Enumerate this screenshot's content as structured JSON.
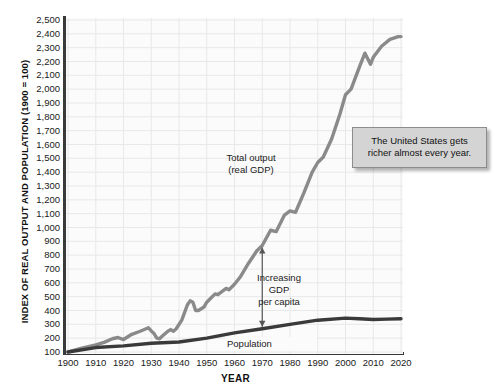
{
  "chart_data": {
    "type": "line",
    "title": "",
    "xlabel": "YEAR",
    "ylabel": "INDEX OF REAL OUTPUT AND POPULATION (1900 = 100)",
    "xlim": [
      1900,
      2020
    ],
    "ylim": [
      100,
      2500
    ],
    "grid": true,
    "legend": "inline-annotations",
    "x_ticks": [
      "1900",
      "1910",
      "1920",
      "1930",
      "1940",
      "1950",
      "1960",
      "1970",
      "1980",
      "1990",
      "2000",
      "2010",
      "2020"
    ],
    "y_ticks": [
      "100",
      "200",
      "300",
      "400",
      "500",
      "600",
      "700",
      "800",
      "900",
      "1,000",
      "1,100",
      "1,200",
      "1,300",
      "1,400",
      "1,500",
      "1,600",
      "1,700",
      "1,800",
      "1,900",
      "2,000",
      "2,100",
      "2,200",
      "2,300",
      "2,400",
      "2,500"
    ],
    "series": [
      {
        "name": "Total output (real GDP)",
        "color": "#8a8a8a",
        "x": [
          1900,
          1905,
          1910,
          1913,
          1916,
          1918,
          1920,
          1923,
          1926,
          1929,
          1930,
          1931,
          1932,
          1933,
          1934,
          1936,
          1937,
          1938,
          1939,
          1941,
          1943,
          1944,
          1945,
          1946,
          1947,
          1949,
          1950,
          1953,
          1954,
          1957,
          1958,
          1960,
          1962,
          1965,
          1968,
          1970,
          1973,
          1975,
          1978,
          1980,
          1982,
          1985,
          1988,
          1990,
          1992,
          1995,
          1998,
          2000,
          2002,
          2005,
          2007,
          2009,
          2010,
          2013,
          2016,
          2019,
          2020
        ],
        "y": [
          100,
          128,
          152,
          170,
          196,
          205,
          190,
          228,
          250,
          275,
          252,
          233,
          200,
          196,
          215,
          250,
          262,
          250,
          268,
          330,
          440,
          470,
          460,
          400,
          400,
          425,
          460,
          520,
          515,
          560,
          550,
          590,
          640,
          740,
          830,
          870,
          980,
          970,
          1090,
          1120,
          1110,
          1250,
          1400,
          1470,
          1510,
          1640,
          1820,
          1960,
          2000,
          2160,
          2260,
          2180,
          2230,
          2310,
          2360,
          2380,
          2380
        ]
      },
      {
        "name": "Population",
        "color": "#3a3a3a",
        "x": [
          1900,
          1910,
          1920,
          1930,
          1940,
          1950,
          1960,
          1970,
          1980,
          1990,
          2000,
          2005,
          2010,
          2015,
          2020
        ],
        "y": [
          100,
          132,
          144,
          163,
          172,
          200,
          238,
          268,
          300,
          330,
          345,
          340,
          335,
          338,
          340
        ]
      }
    ],
    "annotations": [
      {
        "name": "total-output-label",
        "text": "Total output\n(real GDP)"
      },
      {
        "name": "gdp-per-capita-label",
        "text": "Increasing\nGDP\nper capita"
      },
      {
        "name": "population-label",
        "text": "Population"
      }
    ]
  },
  "axis": {
    "y_title": "INDEX OF REAL OUTPUT AND POPULATION (1900 = 100)",
    "x_title": "YEAR"
  },
  "annotations": {
    "total_output_line1": "Total output",
    "total_output_line2": "(real GDP)",
    "gdp_per_capita_line1": "Increasing",
    "gdp_per_capita_line2": "GDP",
    "gdp_per_capita_line3": "per capita",
    "population": "Population"
  },
  "callout": {
    "line1": "The United States gets",
    "line2": "richer almost every year."
  },
  "colors": {
    "gdp_line": "#8a8a8a",
    "population_line": "#3a3a3a",
    "axis": "#3a3a3a",
    "grid": "#e8e8e8",
    "plot_background": "#fbfbfb",
    "callout_background": "#d4d4d4",
    "callout_border": "#8d8d8d"
  }
}
